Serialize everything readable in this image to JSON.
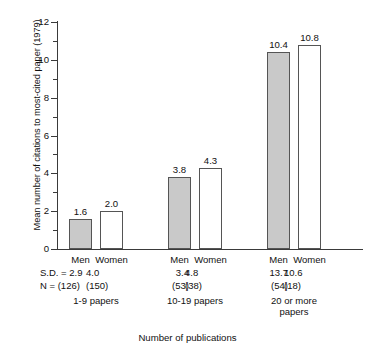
{
  "chart_data": {
    "type": "bar",
    "title": "",
    "xlabel": "Number of publications",
    "ylabel": "Mean number of citations to most-cited paper (1979)",
    "ylim": [
      0,
      12
    ],
    "ytick_labels": [
      "0",
      "2",
      "4",
      "6",
      "8",
      "10",
      "12"
    ],
    "ytick_values": [
      0,
      2,
      4,
      6,
      8,
      10,
      12
    ],
    "yminor_values": [
      1,
      3,
      5,
      7,
      9,
      11
    ],
    "grid": false,
    "legend": "none",
    "categories": [
      "1-9 papers",
      "10-19 papers",
      "20 or more\npapers"
    ],
    "series": [
      {
        "name": "Men",
        "values": [
          1.6,
          3.8,
          10.4
        ],
        "sd": [
          2.9,
          3.4,
          13.7
        ],
        "n": [
          126,
          53,
          54
        ],
        "fill": "#c9c9c9"
      },
      {
        "name": "Women",
        "values": [
          2.0,
          4.3,
          10.8
        ],
        "sd": [
          4.0,
          4.8,
          10.6
        ],
        "n": [
          150,
          38,
          18
        ],
        "fill": "#ffffff"
      }
    ],
    "bars": [
      {
        "group": 0,
        "series": "Men",
        "label": "Men",
        "value": 1.6,
        "value_label": "1.6",
        "sd_label": "S.D. = 2.9",
        "n_label": "N = (126)",
        "style": "men"
      },
      {
        "group": 0,
        "series": "Women",
        "label": "Women",
        "value": 2.0,
        "value_label": "2.0",
        "sd_label": "4.0",
        "n_label": "(150)",
        "style": "women"
      },
      {
        "group": 1,
        "series": "Men",
        "label": "Men",
        "value": 3.8,
        "value_label": "3.8",
        "sd_label": "3.4",
        "n_label": "(53)",
        "style": "men"
      },
      {
        "group": 1,
        "series": "Women",
        "label": "Women",
        "value": 4.3,
        "value_label": "4.3",
        "sd_label": "4.8",
        "n_label": "(38)",
        "style": "women"
      },
      {
        "group": 2,
        "series": "Men",
        "label": "Men",
        "value": 10.4,
        "value_label": "10.4",
        "sd_label": "13.7",
        "n_label": "(54)",
        "style": "men"
      },
      {
        "group": 2,
        "series": "Women",
        "label": "Women",
        "value": 10.8,
        "value_label": "10.8",
        "sd_label": "10.6",
        "n_label": "(18)",
        "style": "women"
      }
    ],
    "row_labels": {
      "sd": "S.D. =",
      "n": "N ="
    },
    "group_labels": [
      "1-9 papers",
      "10-19 papers",
      "20 or more\npapers"
    ],
    "colors": {
      "men_fill": "#c9c9c9",
      "women_fill": "#ffffff",
      "bar_stroke": "#555555",
      "axis": "#3a3a3a",
      "text": "#111111"
    }
  }
}
